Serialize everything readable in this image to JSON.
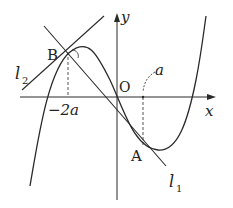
{
  "diagram": {
    "type": "function-graph",
    "axes": {
      "x_label": "x",
      "y_label": "y",
      "origin_label": "O"
    },
    "points": [
      {
        "name": "B",
        "label": "B"
      },
      {
        "name": "A",
        "label": "A"
      }
    ],
    "tick_labels": {
      "neg_2a": "−2a",
      "a": "a"
    },
    "lines": [
      {
        "name": "l1",
        "base": "l",
        "subscript": "1"
      },
      {
        "name": "l2",
        "base": "l",
        "subscript": "2"
      }
    ],
    "colors": {
      "stroke": "#2a2a2a",
      "background": "#ffffff"
    }
  }
}
